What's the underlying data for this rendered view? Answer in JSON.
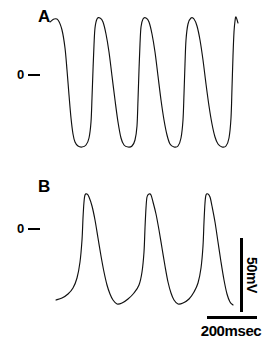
{
  "figure": {
    "background_color": "#ffffff",
    "trace_color": "#101010",
    "panels": [
      {
        "id": "A",
        "letter": "A",
        "zero_label": "0",
        "zero_tick_icon": "dash-tick",
        "spike_count": 5,
        "description": "Bursting oscillation trace with sharp upstrokes and slow decays"
      },
      {
        "id": "B",
        "letter": "B",
        "zero_label": "0",
        "zero_tick_icon": "dash-tick",
        "spike_count": 3,
        "description": "Slower broad action potentials with gradual interspike depolarization"
      }
    ]
  },
  "scalebars": {
    "vertical": {
      "label": "50mV",
      "value": 50,
      "unit": "mV",
      "orientation": "vertical"
    },
    "horizontal": {
      "label": "200msec",
      "value": 200,
      "unit": "msec",
      "orientation": "horizontal"
    }
  },
  "chart_data": {
    "type": "line",
    "title": "",
    "xlabel": "",
    "ylabel": "",
    "grid": false,
    "legend": "none",
    "axis_note": "No drawn axes; zero level indicated by '0 —' tick marks; calibration given by scale bars (50 mV vertical, 200 msec horizontal)",
    "series": [
      {
        "name": "A",
        "panel": "A",
        "zero_level_y_px": 74,
        "peak_y_px": 19,
        "trough_y_px": 146,
        "spike_peaks_x_px": [
          58,
          97,
          140,
          185,
          233
        ],
        "spike_troughs_x_px": [
          78,
          122,
          166,
          211
        ],
        "amplitude_mV": 90,
        "cycle_period_msec": 175,
        "points": [
          [
            50,
            22
          ],
          [
            54,
            19
          ],
          [
            58,
            20
          ],
          [
            62,
            30
          ],
          [
            65,
            48
          ],
          [
            67,
            70
          ],
          [
            69,
            95
          ],
          [
            71,
            118
          ],
          [
            73,
            134
          ],
          [
            75,
            142
          ],
          [
            78,
            146
          ],
          [
            82,
            147
          ],
          [
            86,
            145
          ],
          [
            89,
            138
          ],
          [
            91,
            122
          ],
          [
            92,
            98
          ],
          [
            93,
            70
          ],
          [
            94,
            45
          ],
          [
            95,
            28
          ],
          [
            97,
            19
          ],
          [
            100,
            18
          ],
          [
            103,
            22
          ],
          [
            106,
            34
          ],
          [
            109,
            52
          ],
          [
            112,
            76
          ],
          [
            115,
            100
          ],
          [
            118,
            122
          ],
          [
            121,
            138
          ],
          [
            124,
            145
          ],
          [
            128,
            147
          ],
          [
            132,
            146
          ],
          [
            135,
            140
          ],
          [
            137,
            126
          ],
          [
            138,
            100
          ],
          [
            139,
            70
          ],
          [
            140,
            44
          ],
          [
            141,
            27
          ],
          [
            143,
            19
          ],
          [
            146,
            18
          ],
          [
            149,
            22
          ],
          [
            152,
            34
          ],
          [
            155,
            52
          ],
          [
            158,
            76
          ],
          [
            161,
            100
          ],
          [
            164,
            120
          ],
          [
            167,
            135
          ],
          [
            170,
            144
          ],
          [
            174,
            147
          ],
          [
            178,
            146
          ],
          [
            181,
            138
          ],
          [
            183,
            120
          ],
          [
            184,
            94
          ],
          [
            185,
            64
          ],
          [
            186,
            40
          ],
          [
            188,
            24
          ],
          [
            191,
            18
          ],
          [
            194,
            19
          ],
          [
            197,
            26
          ],
          [
            200,
            40
          ],
          [
            203,
            60
          ],
          [
            206,
            84
          ],
          [
            209,
            106
          ],
          [
            212,
            124
          ],
          [
            215,
            137
          ],
          [
            218,
            144
          ],
          [
            222,
            147
          ],
          [
            226,
            146
          ],
          [
            229,
            138
          ],
          [
            231,
            118
          ],
          [
            232,
            88
          ],
          [
            233,
            56
          ],
          [
            234,
            32
          ],
          [
            235,
            21
          ],
          [
            236,
            17
          ],
          [
            238,
            23
          ]
        ]
      },
      {
        "name": "B",
        "panel": "B",
        "zero_level_y_px": 228,
        "peak_y_px": 194,
        "trough_y_px": 304,
        "spike_peaks_x_px": [
          85,
          148,
          205
        ],
        "spike_troughs_x_px": [
          116,
          176,
          230
        ],
        "amplitude_mV": 78,
        "cycle_period_msec": 250,
        "points": [
          [
            56,
            300
          ],
          [
            62,
            298
          ],
          [
            68,
            294
          ],
          [
            73,
            288
          ],
          [
            77,
            278
          ],
          [
            80,
            262
          ],
          [
            82,
            240
          ],
          [
            83,
            218
          ],
          [
            84,
            202
          ],
          [
            85,
            195
          ],
          [
            87,
            194
          ],
          [
            89,
            197
          ],
          [
            92,
            206
          ],
          [
            95,
            220
          ],
          [
            98,
            238
          ],
          [
            101,
            256
          ],
          [
            104,
            272
          ],
          [
            107,
            285
          ],
          [
            110,
            294
          ],
          [
            113,
            300
          ],
          [
            117,
            304
          ],
          [
            122,
            303
          ],
          [
            128,
            299
          ],
          [
            134,
            293
          ],
          [
            139,
            285
          ],
          [
            142,
            272
          ],
          [
            144,
            252
          ],
          [
            145,
            228
          ],
          [
            146,
            208
          ],
          [
            147,
            197
          ],
          [
            149,
            194
          ],
          [
            151,
            195
          ],
          [
            153,
            202
          ],
          [
            156,
            214
          ],
          [
            159,
            230
          ],
          [
            162,
            248
          ],
          [
            165,
            266
          ],
          [
            168,
            282
          ],
          [
            171,
            293
          ],
          [
            174,
            300
          ],
          [
            178,
            304
          ],
          [
            183,
            303
          ],
          [
            189,
            299
          ],
          [
            194,
            292
          ],
          [
            198,
            283
          ],
          [
            201,
            268
          ],
          [
            203,
            246
          ],
          [
            204,
            222
          ],
          [
            205,
            203
          ],
          [
            206,
            195
          ],
          [
            208,
            194
          ],
          [
            210,
            197
          ],
          [
            212,
            206
          ],
          [
            215,
            222
          ],
          [
            218,
            242
          ],
          [
            221,
            262
          ],
          [
            224,
            280
          ],
          [
            227,
            294
          ],
          [
            230,
            302
          ],
          [
            233,
            305
          ]
        ]
      }
    ]
  }
}
